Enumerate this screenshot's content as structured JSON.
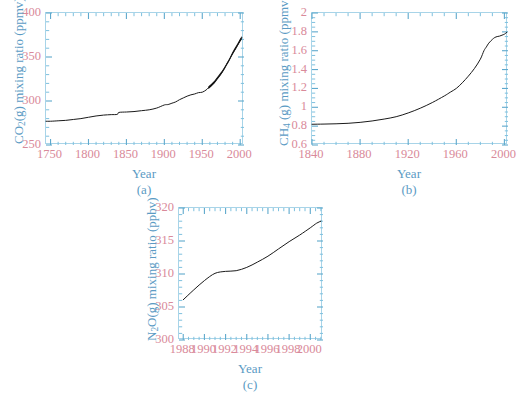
{
  "figure": {
    "background": "#ffffff",
    "frame_color": "#a8d4e8",
    "tick_label_color": "#d98a9a",
    "axis_title_color": "#5b9bc4",
    "curve_color": "#1a1a1a"
  },
  "panels": [
    {
      "id": "a",
      "caption": "(a)",
      "xlabel": "Year",
      "ylabel_prefix": "CO",
      "ylabel_sub": "2",
      "ylabel_suffix": "(g) mixing ratio (ppmv)",
      "xticks": [
        "1750",
        "1800",
        "1850",
        "1900",
        "1950",
        "2000"
      ],
      "yticks": [
        "250",
        "300",
        "350",
        "400"
      ]
    },
    {
      "id": "b",
      "caption": "(b)",
      "xlabel": "Year",
      "ylabel_prefix": "CH",
      "ylabel_sub": "4",
      "ylabel_suffix": " (g) mixing ratio (ppmv)",
      "xticks": [
        "1840",
        "1880",
        "1920",
        "1960",
        "2000"
      ],
      "yticks": [
        "0.6",
        "0.8",
        "1",
        "1.2",
        "1.4",
        "1.6",
        "1.8",
        "2"
      ]
    },
    {
      "id": "c",
      "caption": "(c)",
      "xlabel": "Year",
      "ylabel_prefix": "N",
      "ylabel_sub": "2",
      "ylabel_suffix": "O(g) mixing ratio (ppbv)",
      "xticks": [
        "1988",
        "1990",
        "1992",
        "1994",
        "1996",
        "1998",
        "2000"
      ],
      "yticks": [
        "300",
        "305",
        "310",
        "315",
        "320"
      ]
    }
  ],
  "chart_data": [
    {
      "type": "line",
      "panel": "a",
      "title": "",
      "xlabel": "Year",
      "ylabel": "CO2(g) mixing ratio (ppmv)",
      "xlim": [
        1744,
        2005
      ],
      "ylim": [
        250,
        400
      ],
      "xticks": [
        1750,
        1800,
        1850,
        1900,
        1950,
        2000
      ],
      "yticks": [
        250,
        300,
        350,
        400
      ],
      "xminor_step": 10,
      "yminor_step": 10,
      "grid": false,
      "legend": null,
      "units": "ppmv",
      "series": [
        {
          "name": "CO2 ice core + Mauna Loa record",
          "x": [
            1744,
            1750,
            1760,
            1770,
            1780,
            1790,
            1800,
            1810,
            1820,
            1830,
            1838,
            1840,
            1850,
            1860,
            1870,
            1880,
            1890,
            1900,
            1905,
            1910,
            1915,
            1920,
            1925,
            1930,
            1935,
            1940,
            1945,
            1950,
            1955,
            1958,
            1960,
            1965,
            1970,
            1975,
            1980,
            1985,
            1990,
            1995,
            2000,
            2002
          ],
          "y": [
            277,
            277,
            277.5,
            278,
            279,
            280,
            281.5,
            283,
            284,
            284.5,
            284.8,
            287,
            287.5,
            288,
            289,
            290,
            292,
            295.5,
            296,
            297.5,
            299,
            301.5,
            303.5,
            305.5,
            307,
            308,
            309.5,
            310,
            312.5,
            315,
            317,
            320,
            326,
            331,
            338.5,
            346,
            354,
            361,
            369,
            372
          ]
        },
        {
          "name": "Mauna Loa seasonal oscillation band (upper envelope)",
          "x": [
            1958,
            1962,
            1966,
            1970,
            1974,
            1978,
            1982,
            1986,
            1990,
            1994,
            1998,
            2002
          ],
          "y": [
            316.5,
            319.5,
            323,
            327.5,
            332,
            337,
            343,
            349,
            356,
            362,
            368,
            374
          ]
        },
        {
          "name": "Mauna Loa seasonal oscillation band (lower envelope)",
          "x": [
            1958,
            1962,
            1966,
            1970,
            1974,
            1978,
            1982,
            1986,
            1990,
            1994,
            1998,
            2002
          ],
          "y": [
            313.5,
            316.5,
            320,
            324.5,
            329,
            334,
            340,
            346,
            352.5,
            358.5,
            364.5,
            370
          ]
        }
      ]
    },
    {
      "type": "line",
      "panel": "b",
      "title": "",
      "xlabel": "Year",
      "ylabel": "CH4 (g) mixing ratio (ppmv)",
      "xlim": [
        1840,
        2003
      ],
      "ylim": [
        0.6,
        2.0
      ],
      "xticks": [
        1840,
        1880,
        1920,
        1960,
        2000
      ],
      "yticks": [
        0.6,
        0.8,
        1.0,
        1.2,
        1.4,
        1.6,
        1.8,
        2.0
      ],
      "xminor_step": 10,
      "yminor_step": 0.05,
      "grid": false,
      "legend": null,
      "units": "ppmv",
      "series": [
        {
          "name": "CH4 ice core + atmospheric record",
          "x": [
            1840,
            1850,
            1860,
            1870,
            1880,
            1890,
            1900,
            1910,
            1920,
            1930,
            1940,
            1950,
            1955,
            1960,
            1965,
            1970,
            1975,
            1980,
            1983,
            1985,
            1987,
            1990,
            1992,
            1994,
            1996,
            1998,
            2000,
            2002
          ],
          "y": [
            0.82,
            0.822,
            0.825,
            0.83,
            0.84,
            0.855,
            0.875,
            0.9,
            0.94,
            0.99,
            1.05,
            1.12,
            1.16,
            1.2,
            1.26,
            1.33,
            1.41,
            1.51,
            1.6,
            1.64,
            1.68,
            1.72,
            1.74,
            1.75,
            1.755,
            1.765,
            1.775,
            1.795
          ]
        }
      ]
    },
    {
      "type": "line",
      "panel": "c",
      "title": "",
      "xlabel": "Year",
      "ylabel": "N2O(g) mixing ratio (ppbv)",
      "xlim": [
        1987.6,
        2001.2
      ],
      "ylim": [
        300,
        320
      ],
      "xticks": [
        1988,
        1990,
        1992,
        1994,
        1996,
        1998,
        2000
      ],
      "yticks": [
        300,
        305,
        310,
        315,
        320
      ],
      "xminor_step": 0.5,
      "yminor_step": 1,
      "grid": false,
      "legend": null,
      "units": "ppbv",
      "series": [
        {
          "name": "N2O atmospheric record",
          "x": [
            1988,
            1989,
            1990,
            1991,
            1992,
            1993,
            1994,
            1995,
            1996,
            1997,
            1998,
            1999,
            2000,
            2000.6,
            2001
          ],
          "y": [
            306.1,
            307.6,
            309.0,
            310.1,
            310.4,
            310.5,
            311.0,
            311.8,
            312.7,
            313.8,
            314.9,
            315.9,
            317.0,
            317.7,
            318.0
          ]
        }
      ]
    }
  ]
}
